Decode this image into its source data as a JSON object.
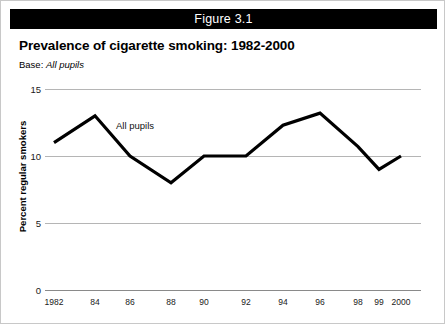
{
  "figure": {
    "bar_label": "Figure 3.1"
  },
  "header": {
    "title": "Prevalence of cigarette smoking: 1982-2000",
    "base_label": "Base:",
    "base_value": "All pupils"
  },
  "chart_data": {
    "type": "line",
    "title": "Prevalence of cigarette smoking: 1982-2000",
    "subtitle": "Base: All pupils",
    "xlabel": "",
    "ylabel": "Percent regular smokers",
    "categories": [
      "1982",
      "84",
      "86",
      "88",
      "90",
      "92",
      "94",
      "96",
      "98",
      "99",
      "2000"
    ],
    "x": [
      1982,
      1984,
      1986,
      1988,
      1990,
      1992,
      1994,
      1996,
      1998,
      1999,
      2000
    ],
    "series": [
      {
        "name": "All pupils",
        "values": [
          11,
          13,
          10,
          8,
          10,
          10,
          12.3,
          13.2,
          10.7,
          9,
          10
        ]
      }
    ],
    "ylim": [
      0,
      15
    ],
    "yticks": [
      0,
      5,
      10,
      15
    ],
    "ytick_labels": [
      "0",
      "5",
      "10",
      "15"
    ],
    "grid": true,
    "legend_position": "inline-annotation",
    "annotations": [
      {
        "text": "All pupils",
        "x": 1985.2,
        "y": 12.2
      }
    ],
    "line_color": "#000000",
    "grid_color": "#b5b5b5"
  },
  "axis": {
    "y_title": "Percent regular smokers"
  }
}
